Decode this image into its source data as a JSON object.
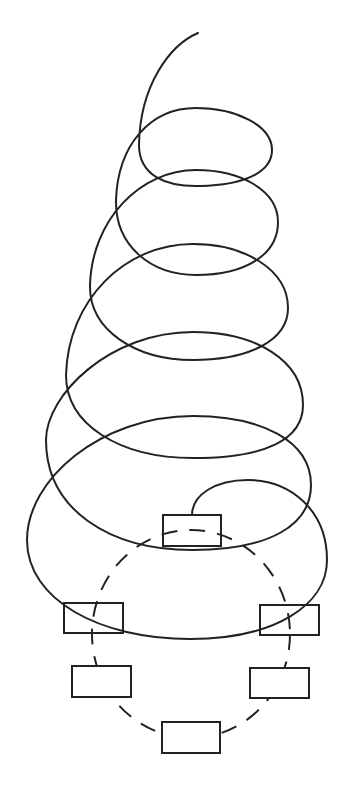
{
  "diagram": {
    "colors": {
      "stroke": "#222222",
      "background": "#ffffff"
    },
    "spiral": {
      "start": [
        198,
        33
      ],
      "end_node": "node-top",
      "loop_count": 6
    },
    "ring": {
      "style": "dashed",
      "center": [
        191,
        634
      ],
      "rx": 99,
      "ry": 104
    },
    "nodes": [
      {
        "id": "node-top",
        "x": 163,
        "y": 515,
        "w": 58,
        "h": 31,
        "label": ""
      },
      {
        "id": "node-left-upper",
        "x": 64,
        "y": 603,
        "w": 59,
        "h": 30,
        "label": ""
      },
      {
        "id": "node-right-upper",
        "x": 260,
        "y": 605,
        "w": 59,
        "h": 30,
        "label": ""
      },
      {
        "id": "node-left-lower",
        "x": 72,
        "y": 666,
        "w": 59,
        "h": 31,
        "label": ""
      },
      {
        "id": "node-right-lower",
        "x": 250,
        "y": 668,
        "w": 59,
        "h": 30,
        "label": ""
      },
      {
        "id": "node-bottom",
        "x": 162,
        "y": 722,
        "w": 58,
        "h": 31,
        "label": ""
      }
    ]
  }
}
